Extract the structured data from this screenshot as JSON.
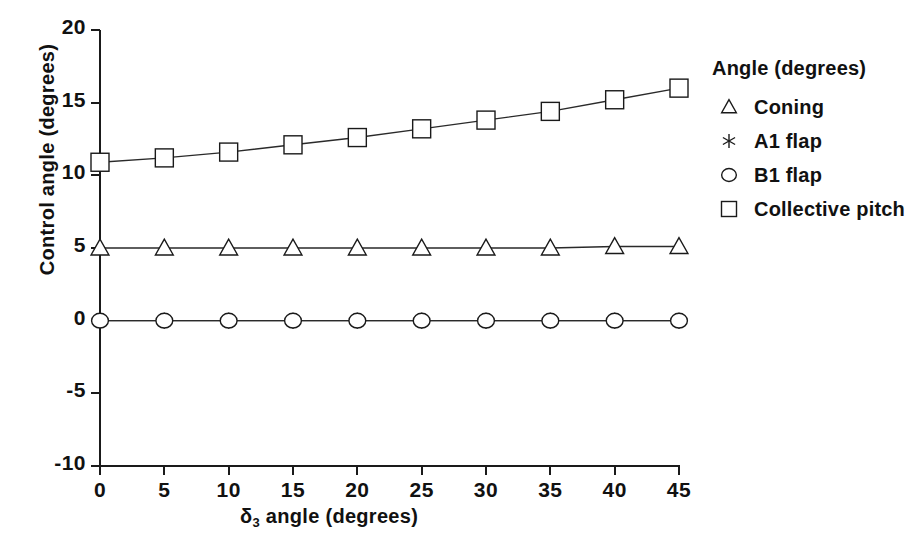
{
  "chart_data": {
    "type": "line",
    "title": "",
    "subtitle": "",
    "xlabel": "δ₃ angle (degrees)",
    "xlabel_main": "angle (degrees)",
    "xlabel_symbol": "δ",
    "xlabel_subscript": "3",
    "ylabel": "Control angle (degrees)",
    "x": [
      0,
      5,
      10,
      15,
      20,
      25,
      30,
      35,
      40,
      45
    ],
    "xlim": [
      0,
      45
    ],
    "ylim": [
      -10,
      20
    ],
    "xticks": [
      "0",
      "5",
      "10",
      "15",
      "20",
      "25",
      "30",
      "35",
      "40",
      "45"
    ],
    "yticks": [
      "20",
      "15",
      "10",
      "5",
      "0",
      "-5",
      "-10"
    ],
    "ytick_values": [
      20,
      15,
      10,
      5,
      0,
      -5,
      -10
    ],
    "grid": false,
    "legend_position": "right",
    "series": [
      {
        "name": "Coning",
        "marker": "triangle",
        "values": [
          5.0,
          5.0,
          5.0,
          5.0,
          5.0,
          5.0,
          5.0,
          5.0,
          5.1,
          5.1
        ]
      },
      {
        "name": "A1 flap",
        "marker": "asterisk",
        "values": [
          0.0,
          0.0,
          0.0,
          0.0,
          0.0,
          0.0,
          0.0,
          0.0,
          0.0,
          0.0
        ]
      },
      {
        "name": "B1 flap",
        "marker": "circle",
        "values": [
          0.0,
          0.0,
          0.0,
          0.0,
          0.0,
          0.0,
          0.0,
          0.0,
          0.0,
          0.0
        ]
      },
      {
        "name": "Collective pitch",
        "marker": "square",
        "values": [
          10.9,
          11.2,
          11.6,
          12.1,
          12.6,
          13.2,
          13.8,
          14.4,
          15.2,
          16.0
        ]
      }
    ]
  },
  "legend": {
    "title": "Angle (degrees)",
    "entries": [
      {
        "label": "Coning",
        "marker": "triangle-marker-icon"
      },
      {
        "label": "A1 flap",
        "marker": "asterisk-marker-icon"
      },
      {
        "label": "B1 flap",
        "marker": "circle-marker-icon"
      },
      {
        "label": "Collective pitch",
        "marker": "square-marker-icon"
      }
    ]
  },
  "colors": {
    "axis": "#1a1a1a",
    "line": "#2a2a2a",
    "marker": "#1a1a1a",
    "background": "#ffffff"
  }
}
